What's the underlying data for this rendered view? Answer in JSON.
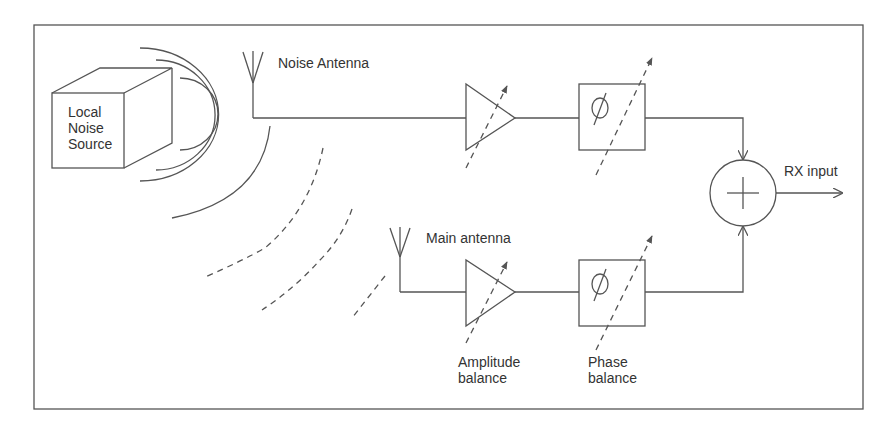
{
  "diagram": {
    "type": "block-diagram",
    "title": "",
    "colors": {
      "stroke": "#555555",
      "text": "#333333",
      "background": "#ffffff"
    },
    "noise_source": {
      "label_lines": [
        "Local",
        "Noise",
        "Source"
      ]
    },
    "noise_antenna": {
      "label": "Noise Antenna"
    },
    "main_antenna": {
      "label": "Main antenna"
    },
    "top_path": {
      "amplifier_symbol": "triangle",
      "phase_shifter_symbol": "∅"
    },
    "bottom_path": {
      "amplifier_symbol": "triangle",
      "phase_shifter_symbol": "∅",
      "amplitude_label_lines": [
        "Amplitude",
        "balance"
      ],
      "phase_label_lines": [
        "Phase",
        "balance"
      ]
    },
    "summer": {
      "symbol": "+"
    },
    "output": {
      "label": "RX input"
    },
    "edges": [
      {
        "from": "Local Noise Source",
        "to": "Noise Antenna",
        "kind": "radiated (solid arcs)"
      },
      {
        "from": "Local Noise Source",
        "to": "Main antenna",
        "kind": "radiated (dashed arcs)"
      },
      {
        "from": "Noise Antenna",
        "to": "Amplifier (top)"
      },
      {
        "from": "Amplifier (top)",
        "to": "Phase shifter (top)"
      },
      {
        "from": "Phase shifter (top)",
        "to": "Summing junction"
      },
      {
        "from": "Main antenna",
        "to": "Amplifier (bottom)"
      },
      {
        "from": "Amplifier (bottom)",
        "to": "Phase shifter (bottom)"
      },
      {
        "from": "Phase shifter (bottom)",
        "to": "Summing junction"
      },
      {
        "from": "Summing junction",
        "to": "RX input"
      }
    ]
  }
}
